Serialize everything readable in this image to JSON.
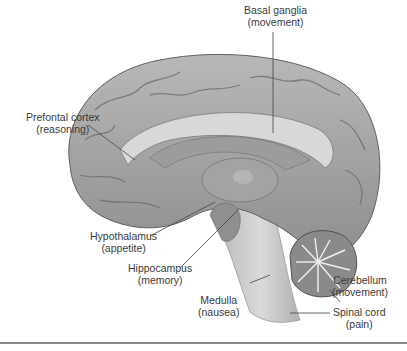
{
  "figure": {
    "colors": {
      "cortex": "#a9a9a9",
      "cortex_dark": "#7d7d7d",
      "white_matter": "#d4d4d4",
      "brainstem": "#c9c9c9",
      "leader_line": "#444444",
      "divider": "#8a8a8a"
    }
  },
  "labels": [
    {
      "id": "basal-ganglia",
      "name": "Basal ganglia",
      "function": "(movement)"
    },
    {
      "id": "prefrontal-cortex",
      "name": "Prefontal cortex",
      "function": "(reasoning)"
    },
    {
      "id": "hypothalamus",
      "name": "Hypothalamus",
      "function": "(appetite)"
    },
    {
      "id": "hippocampus",
      "name": "Hippocampus",
      "function": "(memory)"
    },
    {
      "id": "medulla",
      "name": "Medulla",
      "function": "(nausea)"
    },
    {
      "id": "cerebellum",
      "name": "Cerebellum",
      "function": "(movement)"
    },
    {
      "id": "spinal-cord",
      "name": "Spinal cord",
      "function": "(pain)"
    }
  ]
}
